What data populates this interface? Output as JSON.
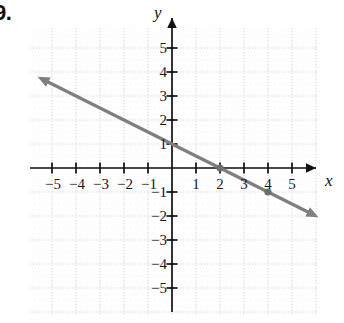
{
  "problem": {
    "number": "9."
  },
  "chart_data": {
    "type": "line",
    "title": "",
    "xlabel": "x",
    "ylabel": "y",
    "xlim": [
      -6,
      6
    ],
    "ylim": [
      -6,
      6
    ],
    "grid": true,
    "grid_style": "dotted",
    "xticks": [
      -5,
      -4,
      -3,
      -2,
      -1,
      1,
      2,
      3,
      4,
      5
    ],
    "yticks": [
      5,
      4,
      3,
      2,
      1,
      -1,
      -2,
      -3,
      -4,
      -5
    ],
    "xtick_labels": [
      "−5",
      "−4",
      "−3",
      "−2",
      "−1",
      "1",
      "2",
      "3",
      "4",
      "5"
    ],
    "ytick_labels": [
      "5",
      "4",
      "3",
      "2",
      "1",
      "−1",
      "−2",
      "−3",
      "−4",
      "−5"
    ],
    "series": [
      {
        "name": "line",
        "equation": "y = -0.5x + 1",
        "slope": -0.5,
        "intercept": 1,
        "color": "#7f7f7f",
        "arrows": "both",
        "x": [
          -5.6,
          6.1
        ],
        "y": [
          3.8,
          -2.05
        ],
        "points": [
          {
            "x": 2,
            "y": 0,
            "label": ""
          },
          {
            "x": 4,
            "y": -1,
            "label": ""
          }
        ]
      }
    ],
    "colors": {
      "line": "#7f7f7f",
      "axis": "#111111",
      "grid": "#d8d8d8",
      "text": "#1a1a1a",
      "point": "#6e6e6e"
    }
  }
}
